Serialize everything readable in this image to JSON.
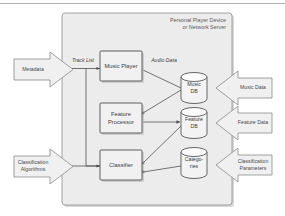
{
  "figure": {
    "container_label_line1": "Personal Player Device",
    "container_label_line2": "or Network Server"
  },
  "input_arrows": [
    {
      "name": "metadata",
      "label_line1": "Metadata",
      "label_line2": ""
    },
    {
      "name": "classification-algorithms",
      "label_line1": "Classification",
      "label_line2": "Algorithms"
    }
  ],
  "process_boxes": [
    {
      "name": "music-player",
      "label_line1": "Music Player",
      "label_line2": ""
    },
    {
      "name": "feature-processor",
      "label_line1": "Feature",
      "label_line2": "Processor"
    },
    {
      "name": "classifier",
      "label_line1": "Classifier",
      "label_line2": ""
    }
  ],
  "databases": [
    {
      "name": "music-db",
      "label_line1": "Music",
      "label_line2": "DB"
    },
    {
      "name": "feature-db",
      "label_line1": "Feature",
      "label_line2": "DB"
    },
    {
      "name": "categories-db",
      "label_line1": "Catego-",
      "label_line2": "ries"
    }
  ],
  "output_arrows": [
    {
      "name": "music-data",
      "label_line1": "Music Data",
      "label_line2": ""
    },
    {
      "name": "feature-data",
      "label_line1": "Feature Data",
      "label_line2": ""
    },
    {
      "name": "classification-parameters",
      "label_line1": "Classification",
      "label_line2": "Parameters"
    }
  ],
  "flow_labels": [
    {
      "name": "track-list",
      "label": "Track List"
    },
    {
      "name": "audio-data",
      "label": "Audio Data"
    }
  ],
  "colors": {
    "container_fill": "#ececec",
    "box_fill": "#f1f1f1",
    "arrow_fill": "#f0f0f0",
    "cylinder_fill": "#f3f3f3",
    "stroke_dark": "#4e4e4e",
    "stroke_light": "#8a8a8a",
    "text": "#3d3d3d",
    "page_background": "#ffffff"
  }
}
